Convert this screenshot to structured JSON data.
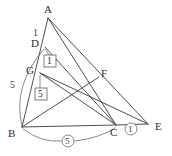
{
  "figure": {
    "stroke_color": "#3a3a3a",
    "arc_color": "#6b6b6b",
    "background": "#ffffff"
  },
  "vertices": [
    {
      "id": "A",
      "label": "A",
      "x": 48,
      "y": 18
    },
    {
      "id": "D",
      "label": "D",
      "x": 45,
      "y": 47
    },
    {
      "id": "G",
      "label": "G",
      "x": 40,
      "y": 73
    },
    {
      "id": "F",
      "label": "F",
      "x": 99,
      "y": 77
    },
    {
      "id": "B",
      "label": "B",
      "x": 22,
      "y": 127
    },
    {
      "id": "C",
      "label": "C",
      "x": 116,
      "y": 125
    },
    {
      "id": "E",
      "label": "E",
      "x": 148,
      "y": 124
    }
  ],
  "vertex_labels": [
    {
      "name": "vertex-label-a",
      "text": "A",
      "x": 44,
      "y": 4
    },
    {
      "name": "vertex-label-d",
      "text": "D",
      "x": 31,
      "y": 38
    },
    {
      "name": "vertex-label-g",
      "text": "G",
      "x": 26,
      "y": 65
    },
    {
      "name": "vertex-label-f",
      "text": "F",
      "x": 101,
      "y": 68
    },
    {
      "name": "vertex-label-b",
      "text": "B",
      "x": 8,
      "y": 128
    },
    {
      "name": "vertex-label-c",
      "text": "C",
      "x": 110,
      "y": 127
    },
    {
      "name": "vertex-label-e",
      "text": "E",
      "x": 155,
      "y": 121
    }
  ],
  "segments": [
    {
      "name": "segment-a-b",
      "from": "A",
      "to": "B"
    },
    {
      "name": "segment-a-c",
      "from": "A",
      "to": "C"
    },
    {
      "name": "segment-a-e",
      "from": "A",
      "to": "E"
    },
    {
      "name": "segment-b-c",
      "from": "B",
      "to": "C"
    },
    {
      "name": "segment-c-e",
      "from": "C",
      "to": "E"
    },
    {
      "name": "segment-d-c",
      "from": "D",
      "to": "C"
    },
    {
      "name": "segment-g-e",
      "from": "G",
      "to": "E"
    },
    {
      "name": "segment-g-c",
      "from": "G",
      "to": "C"
    },
    {
      "name": "segment-b-f",
      "from": "B",
      "to": "F"
    }
  ],
  "plain_labels": [
    {
      "name": "length-label-ad",
      "text": "1",
      "x": 33,
      "y": 28
    },
    {
      "name": "length-label-db",
      "text": "5",
      "x": 10,
      "y": 80
    }
  ],
  "boxed_labels": [
    {
      "name": "boxed-label-1",
      "text": "1",
      "x": 48,
      "y": 60,
      "target_x": 45,
      "target_y": 49
    },
    {
      "name": "boxed-label-5",
      "text": "5",
      "x": 40,
      "y": 93,
      "target_x": 40,
      "target_y": 75
    }
  ],
  "circled_labels": [
    {
      "name": "circled-label-5",
      "text": "5",
      "x": 67,
      "y": 140
    },
    {
      "name": "circled-label-1",
      "text": "1",
      "x": 130,
      "y": 128
    }
  ],
  "arcs": [
    {
      "name": "arc-d-to-b",
      "label": "5",
      "from": "D",
      "to": "B"
    },
    {
      "name": "arc-b-to-c",
      "label": "5",
      "from": "B",
      "to": "C"
    }
  ]
}
